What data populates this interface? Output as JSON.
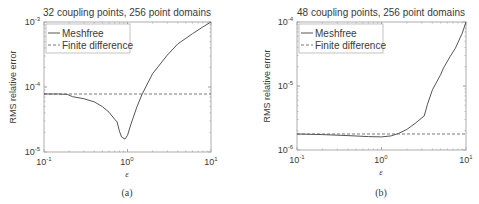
{
  "chart_data": [
    {
      "type": "line",
      "panel_label": "(a)",
      "title": "32 coupling points, 256 point domains",
      "xlabel": "ε",
      "ylabel": "RMS relative error",
      "xscale": "log",
      "yscale": "log",
      "xlim": [
        0.1,
        10
      ],
      "ylim": [
        1e-05,
        0.001
      ],
      "xticks": [
        "10^-1",
        "10^0",
        "10^1"
      ],
      "yticks": [
        "10^-5",
        "10^-4",
        "10^-3"
      ],
      "grid": false,
      "legend_position": "upper left",
      "series": [
        {
          "name": "Meshfree",
          "style": "solid",
          "x": [
            0.1,
            0.15,
            0.19,
            0.22,
            0.3,
            0.4,
            0.5,
            0.6,
            0.7,
            0.75,
            0.8,
            0.85,
            0.93,
            1.0,
            1.1,
            1.3,
            1.5,
            2.0,
            3.0,
            4.0,
            6.0,
            8.0,
            10.0
          ],
          "y": [
            7.8e-05,
            7.8e-05,
            7.7e-05,
            7.1e-05,
            6.6e-05,
            5.9e-05,
            5e-05,
            4.1e-05,
            3.2e-05,
            2.9e-05,
            2.1e-05,
            1.7e-05,
            1.58e-05,
            1.8e-05,
            2.7e-05,
            5e-05,
            7.8e-05,
            0.00016,
            0.00031,
            0.00046,
            0.00066,
            0.00084,
            0.001
          ]
        },
        {
          "name": "Finite difference",
          "style": "dashed",
          "x": [
            0.1,
            10
          ],
          "y": [
            7.8e-05,
            7.8e-05
          ]
        }
      ]
    },
    {
      "type": "line",
      "panel_label": "(b)",
      "title": "48 coupling points, 256 point domains",
      "xlabel": "ε",
      "ylabel": "RMS relative error",
      "xscale": "log",
      "yscale": "log",
      "xlim": [
        0.1,
        10
      ],
      "ylim": [
        1e-06,
        0.0001
      ],
      "xticks": [
        "10^-1",
        "10^0",
        "10^1"
      ],
      "yticks": [
        "10^-6",
        "10^-5",
        "10^-4"
      ],
      "grid": false,
      "legend_position": "upper left",
      "series": [
        {
          "name": "Meshfree",
          "style": "solid",
          "x": [
            0.1,
            0.2,
            0.4,
            0.7,
            1.0,
            1.3,
            1.6,
            2.0,
            2.5,
            3.2,
            3.5,
            4.0,
            5.0,
            5.4,
            6.5,
            7.5,
            9.0,
            10.0
          ],
          "y": [
            1.78e-06,
            1.74e-06,
            1.68e-06,
            1.62e-06,
            1.6e-06,
            1.66e-06,
            1.82e-06,
            2.1e-06,
            2.6e-06,
            3.4e-06,
            5.2e-06,
            8.7e-06,
            1.5e-05,
            1.9e-05,
            2.9e-05,
            3.9e-05,
            6.6e-05,
            0.0001
          ]
        },
        {
          "name": "Finite difference",
          "style": "dashed",
          "x": [
            0.1,
            10
          ],
          "y": [
            1.78e-06,
            1.78e-06
          ]
        }
      ]
    }
  ],
  "panels": [
    {
      "title": "32 coupling points, 256 point domains",
      "ylabel": "RMS relative error",
      "xlabel": "ε",
      "caption": "(a)",
      "ytick_top_exp": "-3",
      "ytick_mid_exp": "-4",
      "ytick_bot_exp": "-5",
      "xtick_left_exp": "-1",
      "xtick_mid_exp": "0",
      "xtick_right_exp": "1",
      "tick_base": "10",
      "legend": [
        "Meshfree",
        "Finite difference"
      ]
    },
    {
      "title": "48 coupling points, 256 point domains",
      "ylabel": "RMS relative error",
      "xlabel": "ε",
      "caption": "(b)",
      "ytick_top_exp": "-4",
      "ytick_mid_exp": "-5",
      "ytick_bot_exp": "-6",
      "xtick_left_exp": "-1",
      "xtick_mid_exp": "0",
      "xtick_right_exp": "1",
      "tick_base": "10",
      "legend": [
        "Meshfree",
        "Finite difference"
      ]
    }
  ]
}
